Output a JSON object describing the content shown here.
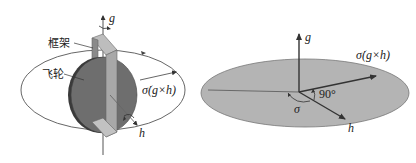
{
  "left_figure": {
    "labels": {
      "frame": "框架",
      "flywheel": "飞轮",
      "g_axis": "g",
      "h_axis": "h",
      "sigma_dot_cross": "σ̇(g×h)"
    },
    "colors": {
      "wheel_face": "#6e6e6e",
      "wheel_edge": "#3a3a3a",
      "frame": "#a8a8a8",
      "ellipse": "#555555"
    }
  },
  "right_figure": {
    "labels": {
      "g_axis": "g",
      "h_axis": "h",
      "sigma": "σ",
      "right_angle": "90°",
      "sigma_dot_cross": "σ̇(g×h)"
    },
    "colors": {
      "disk_fill": "#b4b4b4",
      "disk_stroke": "#777777",
      "arrow": "#333333"
    }
  }
}
